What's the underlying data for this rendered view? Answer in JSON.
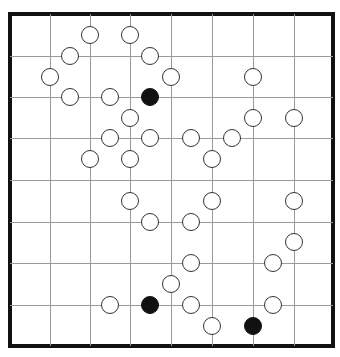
{
  "puzzle": {
    "type": "masyu",
    "columns": 8,
    "rows": 8,
    "colors": {
      "border": "#111111",
      "grid": "#9a9a9a",
      "white_pearl_fill": "#ffffff",
      "black_pearl_fill": "#111111"
    },
    "grid_lines": {
      "vertical_x": [
        50,
        90,
        130,
        171,
        212,
        253,
        294
      ],
      "horizontal_y": [
        56,
        97,
        138,
        180,
        222,
        263,
        305
      ]
    },
    "pearls": [
      {
        "x": 90,
        "y": 35,
        "color": "white"
      },
      {
        "x": 130,
        "y": 35,
        "color": "white"
      },
      {
        "x": 70,
        "y": 56,
        "color": "white"
      },
      {
        "x": 150,
        "y": 56,
        "color": "white"
      },
      {
        "x": 50,
        "y": 77,
        "color": "white"
      },
      {
        "x": 171,
        "y": 77,
        "color": "white"
      },
      {
        "x": 253,
        "y": 77,
        "color": "white"
      },
      {
        "x": 70,
        "y": 97,
        "color": "white"
      },
      {
        "x": 110,
        "y": 97,
        "color": "white"
      },
      {
        "x": 150,
        "y": 97,
        "color": "black"
      },
      {
        "x": 130,
        "y": 118,
        "color": "white"
      },
      {
        "x": 253,
        "y": 118,
        "color": "white"
      },
      {
        "x": 294,
        "y": 118,
        "color": "white"
      },
      {
        "x": 110,
        "y": 138,
        "color": "white"
      },
      {
        "x": 150,
        "y": 138,
        "color": "white"
      },
      {
        "x": 191,
        "y": 138,
        "color": "white"
      },
      {
        "x": 232,
        "y": 138,
        "color": "white"
      },
      {
        "x": 90,
        "y": 159,
        "color": "white"
      },
      {
        "x": 130,
        "y": 159,
        "color": "white"
      },
      {
        "x": 212,
        "y": 159,
        "color": "white"
      },
      {
        "x": 130,
        "y": 201,
        "color": "white"
      },
      {
        "x": 212,
        "y": 201,
        "color": "white"
      },
      {
        "x": 294,
        "y": 201,
        "color": "white"
      },
      {
        "x": 150,
        "y": 222,
        "color": "white"
      },
      {
        "x": 191,
        "y": 222,
        "color": "white"
      },
      {
        "x": 294,
        "y": 242,
        "color": "white"
      },
      {
        "x": 191,
        "y": 263,
        "color": "white"
      },
      {
        "x": 273,
        "y": 263,
        "color": "white"
      },
      {
        "x": 171,
        "y": 284,
        "color": "white"
      },
      {
        "x": 110,
        "y": 305,
        "color": "white"
      },
      {
        "x": 150,
        "y": 305,
        "color": "black"
      },
      {
        "x": 191,
        "y": 305,
        "color": "white"
      },
      {
        "x": 273,
        "y": 305,
        "color": "white"
      },
      {
        "x": 212,
        "y": 326,
        "color": "white"
      },
      {
        "x": 253,
        "y": 326,
        "color": "black"
      }
    ]
  }
}
